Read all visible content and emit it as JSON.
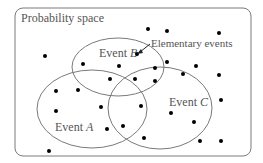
{
  "diagram": {
    "frame_label": "Probability space",
    "arrow_label": "Elementary events",
    "events": [
      {
        "id": "A",
        "prefix": "Event ",
        "letter": "A",
        "cx": 92,
        "cy": 109,
        "rx": 55,
        "ry": 39,
        "label_x": 55,
        "label_y": 131
      },
      {
        "id": "B",
        "prefix": "Event ",
        "letter": "B",
        "cx": 118,
        "cy": 67,
        "rx": 46,
        "ry": 29,
        "label_x": 99,
        "label_y": 57
      },
      {
        "id": "C",
        "prefix": "Event ",
        "letter": "C",
        "cx": 160,
        "cy": 108,
        "rx": 52,
        "ry": 41,
        "label_x": 169,
        "label_y": 106
      }
    ],
    "points": [
      [
        45,
        56
      ],
      [
        148,
        29
      ],
      [
        167,
        31
      ],
      [
        219,
        33
      ],
      [
        83,
        64
      ],
      [
        119,
        66
      ],
      [
        137,
        54
      ],
      [
        167,
        62
      ],
      [
        196,
        66
      ],
      [
        155,
        68
      ],
      [
        110,
        79
      ],
      [
        135,
        79
      ],
      [
        155,
        81
      ],
      [
        183,
        74
      ],
      [
        219,
        75
      ],
      [
        56,
        91
      ],
      [
        78,
        90
      ],
      [
        56,
        111
      ],
      [
        101,
        107
      ],
      [
        141,
        106
      ],
      [
        171,
        113
      ],
      [
        194,
        122
      ],
      [
        221,
        100
      ],
      [
        107,
        129
      ],
      [
        123,
        126
      ],
      [
        144,
        138
      ],
      [
        200,
        141
      ],
      [
        221,
        141
      ],
      [
        49,
        151
      ]
    ],
    "colors": {
      "stroke": "#7a7a7a",
      "dot": "#000000",
      "text": "#555555"
    }
  }
}
